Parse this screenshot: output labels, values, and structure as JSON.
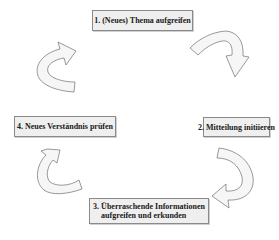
{
  "diagram": {
    "type": "cycle",
    "steps": [
      {
        "id": 1,
        "label": "1. (Neues) Thema aufgreifen"
      },
      {
        "id": 2,
        "label": "2. Mitteilung initiieren"
      },
      {
        "id": 3,
        "label_line1": "3. Überraschende Informationen",
        "label_line2": "aufgreifen und erkunden"
      },
      {
        "id": 4,
        "label": "4. Neues Verständnis prüfen"
      }
    ],
    "arrows": [
      {
        "from": 1,
        "to": 2,
        "icon": "curved-arrow-down-right"
      },
      {
        "from": 2,
        "to": 3,
        "icon": "curved-arrow-down-left"
      },
      {
        "from": 3,
        "to": 4,
        "icon": "curved-arrow-up-left"
      },
      {
        "from": 4,
        "to": 1,
        "icon": "curved-arrow-up-right"
      }
    ],
    "colors": {
      "box_fill": "#efefef",
      "box_border": "#8a8a8a",
      "arrow_fill": "#f6f6f6",
      "arrow_stroke": "#6e6e6e"
    }
  }
}
